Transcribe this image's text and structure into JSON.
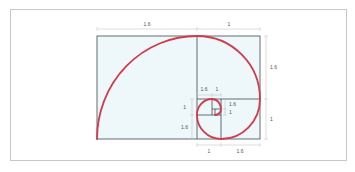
{
  "diagram": {
    "colors": {
      "spiral": "#d23a4a",
      "fill": "#eef7fa",
      "lines": "#3d4a50",
      "dimension": "#b8b8b8",
      "frame": "#c8c8c8"
    },
    "labels": {
      "top_left": "1.6",
      "top_right": "1",
      "right_upper": "1.6",
      "right_lower": "1",
      "bottom_left": "1",
      "bottom_right": "1.6",
      "inner_top_left": "1.6",
      "inner_top_right": "1",
      "inner_left_upper": "1",
      "inner_left_lower": "1.6",
      "inner_right_upper": "1.6",
      "inner_right_lower": "1"
    }
  }
}
